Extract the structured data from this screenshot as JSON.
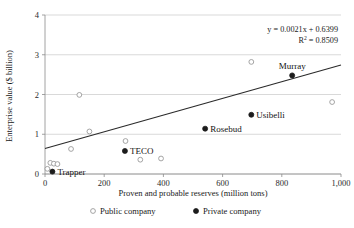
{
  "chart_data": {
    "type": "scatter",
    "title": "",
    "xlabel": "Proven and probable reserves (million tons)",
    "ylabel": "Enterprise value ($ billion)",
    "xlim": [
      0,
      1000
    ],
    "ylim": [
      0,
      4
    ],
    "xticks": [
      "0",
      "200",
      "400",
      "600",
      "800",
      "1,000"
    ],
    "xtick_values": [
      0,
      200,
      400,
      600,
      800,
      1000
    ],
    "yticks": [
      "0",
      "1",
      "2",
      "3",
      "4"
    ],
    "ytick_values": [
      0,
      1,
      2,
      3,
      4
    ],
    "grid": "horizontal",
    "legend_position": "below-axis",
    "annotations": {
      "equation": "y = 0.0021x + 0.6399",
      "r_squared_prefix": "R",
      "r_squared_sup": "2",
      "r_squared_value": " = 0.8509"
    },
    "trendline": {
      "slope": 0.0021,
      "intercept": 0.6399,
      "x_start": 0,
      "x_end": 1000
    },
    "series": [
      {
        "name": "Public company",
        "marker": "open-circle",
        "color": "#9a9a9a",
        "points": [
          {
            "x": 8,
            "y": 0.13,
            "label": ""
          },
          {
            "x": 18,
            "y": 0.28,
            "label": ""
          },
          {
            "x": 30,
            "y": 0.26,
            "label": ""
          },
          {
            "x": 42,
            "y": 0.25,
            "label": ""
          },
          {
            "x": 88,
            "y": 0.63,
            "label": ""
          },
          {
            "x": 116,
            "y": 1.99,
            "label": ""
          },
          {
            "x": 150,
            "y": 1.07,
            "label": ""
          },
          {
            "x": 272,
            "y": 0.83,
            "label": ""
          },
          {
            "x": 322,
            "y": 0.36,
            "label": ""
          },
          {
            "x": 392,
            "y": 0.39,
            "label": ""
          },
          {
            "x": 697,
            "y": 2.82,
            "label": ""
          },
          {
            "x": 970,
            "y": 1.81,
            "label": ""
          }
        ]
      },
      {
        "name": "Private company",
        "marker": "filled-circle",
        "color": "#1c1c1c",
        "points": [
          {
            "x": 25,
            "y": 0.06,
            "label": "Trapper"
          },
          {
            "x": 270,
            "y": 0.58,
            "label": "TECO"
          },
          {
            "x": 541,
            "y": 1.14,
            "label": "Rosebud"
          },
          {
            "x": 697,
            "y": 1.49,
            "label": "Usibelli"
          },
          {
            "x": 835,
            "y": 2.48,
            "label": "Murray"
          }
        ]
      }
    ],
    "point_labels": [
      {
        "text": "Trapper",
        "x": 25,
        "y": 0.06,
        "anchor": "right"
      },
      {
        "text": "TECO",
        "x": 270,
        "y": 0.58,
        "anchor": "right"
      },
      {
        "text": "Rosebud",
        "x": 541,
        "y": 1.14,
        "anchor": "right"
      },
      {
        "text": "Usibelli",
        "x": 697,
        "y": 1.49,
        "anchor": "right"
      },
      {
        "text": "Murray",
        "x": 835,
        "y": 2.48,
        "anchor": "above"
      }
    ]
  },
  "legend": {
    "items": [
      {
        "label": "Public company",
        "marker": "open-circle"
      },
      {
        "label": "Private company",
        "marker": "filled-circle"
      }
    ]
  }
}
